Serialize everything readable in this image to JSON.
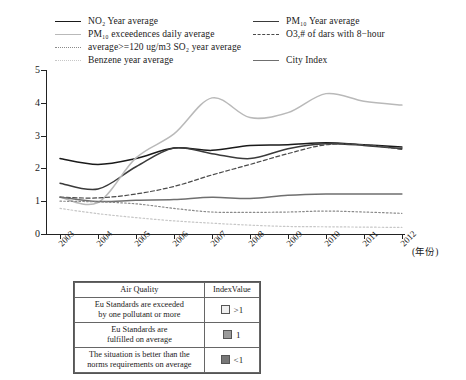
{
  "legend": {
    "items": [
      {
        "label": "NO₂ Year average",
        "style": "solid",
        "color": "#1a1a1a",
        "col": 0,
        "row": 0
      },
      {
        "label": "PM₁₀ exceedences daily average",
        "style": "thin",
        "color": "#b9b9b9",
        "col": 0,
        "row": 1
      },
      {
        "label": "average>=120 ug/m3 SO₂ year average",
        "style": "dot",
        "color": "#8a8a8a",
        "col": 0,
        "row": 2
      },
      {
        "label": "Benzene year average",
        "style": "dot",
        "color": "#c7c7c7",
        "col": 0,
        "row": 3
      },
      {
        "label": "PM₁₀ Year average",
        "style": "solid",
        "color": "#3a3a3a",
        "col": 1,
        "row": 0
      },
      {
        "label": "O3,# of dars with 8−hour",
        "style": "dash",
        "color": "#4a4a4a",
        "col": 1,
        "row": 1
      },
      {
        "label": "City Index",
        "style": "solid",
        "color": "#6f6f6f",
        "col": 1,
        "row": 3
      }
    ]
  },
  "chart_data": {
    "type": "line",
    "title": "",
    "xlabel": "(年份)",
    "ylabel": "",
    "x": [
      "2003",
      "2004",
      "2005",
      "2006",
      "2007",
      "2008",
      "2009",
      "2010",
      "2011",
      "2012"
    ],
    "ylim": [
      0,
      5
    ],
    "yticks": [
      0,
      1,
      2,
      3,
      4,
      5
    ],
    "grid": false,
    "legend_position": "top",
    "series": [
      {
        "name": "NO₂ Year average",
        "color": "#1a1a1a",
        "style": "solid",
        "values": [
          2.3,
          2.12,
          2.3,
          2.62,
          2.55,
          2.7,
          2.72,
          2.78,
          2.72,
          2.65
        ]
      },
      {
        "name": "PM₁₀ Year average",
        "color": "#3a3a3a",
        "style": "solid",
        "values": [
          1.55,
          1.37,
          2.05,
          2.62,
          2.45,
          2.3,
          2.6,
          2.75,
          2.7,
          2.6
        ]
      },
      {
        "name": "PM₁₀ exceedences daily average",
        "color": "#b9b9b9",
        "style": "solid",
        "values": [
          1.12,
          0.96,
          2.32,
          3.05,
          4.15,
          3.55,
          3.7,
          4.28,
          4.05,
          3.93
        ]
      },
      {
        "name": "O3,# of dars with 8−hour",
        "color": "#4a4a4a",
        "style": "dash",
        "values": [
          1.12,
          1.1,
          1.22,
          1.45,
          1.8,
          2.12,
          2.45,
          2.72,
          2.72,
          2.58
        ]
      },
      {
        "name": "City Index",
        "color": "#6f6f6f",
        "style": "solid",
        "values": [
          1.13,
          0.99,
          1.03,
          1.05,
          1.12,
          1.08,
          1.18,
          1.22,
          1.22,
          1.22
        ]
      },
      {
        "name": "average>=120 ug/m3 SO₂ year average",
        "color": "#8a8a8a",
        "style": "dot",
        "values": [
          1.0,
          0.98,
          0.92,
          0.78,
          0.67,
          0.66,
          0.67,
          0.7,
          0.67,
          0.63
        ]
      },
      {
        "name": "Benzene year average",
        "color": "#c7c7c7",
        "style": "dot",
        "values": [
          0.78,
          0.62,
          0.5,
          0.4,
          0.33,
          0.27,
          0.23,
          0.22,
          0.21,
          0.2
        ]
      }
    ]
  },
  "table": {
    "headers": [
      "Air Quality",
      "IndexValue"
    ],
    "rows": [
      {
        "desc": "Eu Standards are exceeded\nby one pollutant or more",
        "value": ">1",
        "swatch": "#efefef"
      },
      {
        "desc": "Eu Standards are\nfulfilled on average",
        "value": "1",
        "swatch": "#9a9a9a"
      },
      {
        "desc": "The situation is better than the\nnorms requirements on average",
        "value": "<1",
        "swatch": "#777777"
      }
    ]
  }
}
